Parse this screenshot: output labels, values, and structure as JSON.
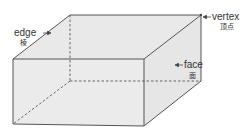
{
  "diagram": {
    "type": "rectangular-prism",
    "colors": {
      "face_fill": "#ebebeb",
      "top_fill": "#e9e9e9",
      "side_fill": "#e6e6e6",
      "edge_stroke": "#555555",
      "hidden_edge_stroke": "#666666",
      "label_text": "#333333"
    },
    "labels": {
      "edge": {
        "en": "edge",
        "zh": "棱"
      },
      "vertex": {
        "en": "vertex",
        "zh": "顶点"
      },
      "face": {
        "en": "face",
        "zh": "面"
      }
    },
    "vertices": {
      "front_top_left": [
        13,
        59
      ],
      "front_top_right": [
        144,
        59
      ],
      "front_bottom_left": [
        13,
        124
      ],
      "front_bottom_right": [
        144,
        126
      ],
      "back_top_left": [
        70,
        15
      ],
      "back_top_right": [
        201,
        15
      ],
      "back_bottom_right": [
        201,
        81
      ],
      "back_bottom_left": [
        70,
        81
      ]
    }
  }
}
